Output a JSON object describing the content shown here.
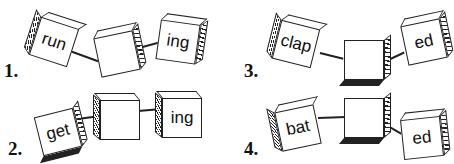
{
  "puzzles": [
    {
      "number": "1.",
      "base": "run",
      "middle": "",
      "suffix": "ing"
    },
    {
      "number": "2.",
      "base": "get",
      "middle": "",
      "suffix": "ing"
    },
    {
      "number": "3.",
      "base": "clap",
      "middle": "",
      "suffix": "ed"
    },
    {
      "number": "4.",
      "base": "bat",
      "middle": "",
      "suffix": "ed"
    }
  ]
}
